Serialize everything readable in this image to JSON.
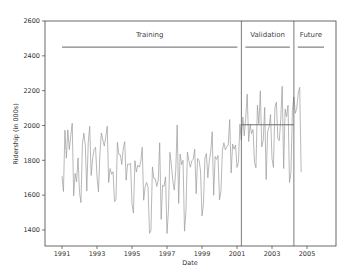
{
  "chart_data": {
    "type": "line",
    "title": "",
    "xlabel": "Date",
    "ylabel": "Ridership (in 000s)",
    "xlim": [
      1990.5,
      2006.6
    ],
    "ylim": [
      1308,
      2600
    ],
    "grid": false,
    "x_ticks": [
      "1991",
      "1993",
      "1995",
      "1997",
      "1999",
      "2001",
      "2003",
      "2005"
    ],
    "x_tick_values": [
      1991,
      1993,
      1995,
      1997,
      1999,
      2001,
      2003,
      2005
    ],
    "y_ticks": [
      "1400",
      "1600",
      "1800",
      "2000",
      "2200",
      "2400",
      "2600"
    ],
    "y_tick_values": [
      1400,
      1600,
      1800,
      2000,
      2200,
      2400,
      2600
    ],
    "partitions": [
      {
        "name": "Training",
        "start": 1991.0,
        "end": 2001.25
      },
      {
        "name": "Validation",
        "start": 2001.25,
        "end": 2004.25
      },
      {
        "name": "Future",
        "start": 2004.25,
        "end": 2006.2
      }
    ],
    "partition_label_y": 2450,
    "naive_forecast_value": 2004,
    "series": [
      {
        "name": "Ridership",
        "x_start": 1991.0,
        "x_step": 0.08333,
        "values": [
          1709,
          1621,
          1973,
          1812,
          1975,
          1862,
          1940,
          2013,
          1596,
          1725,
          1676,
          1814,
          1615,
          1557,
          1891,
          1956,
          1885,
          1623,
          1903,
          1996,
          1713,
          1810,
          1862,
          1875,
          1705,
          1619,
          1837,
          1957,
          1917,
          1882,
          1933,
          1996,
          1673,
          1753,
          1720,
          1734,
          1563,
          1574,
          1903,
          1834,
          1831,
          1776,
          1868,
          1907,
          1686,
          1779,
          1776,
          1783,
          1548,
          1497,
          1798,
          1733,
          1772,
          1761,
          1792,
          1875,
          1571,
          1647,
          1673,
          1646,
          1381,
          1396,
          1762,
          1695,
          1693,
          1650,
          1687,
          1901,
          1461,
          1657,
          1651,
          1705,
          1380,
          1510,
          1846,
          1773,
          1682,
          1629,
          1743,
          2003,
          1552,
          1836,
          1775,
          1800,
          1393,
          1509,
          1847,
          1799,
          1760,
          1798,
          1806,
          1864,
          1608,
          1811,
          1798,
          1739,
          1481,
          1547,
          1812,
          1839,
          1700,
          1797,
          1848,
          1964,
          1599,
          1822,
          1805,
          1828,
          1573,
          1622,
          1857,
          1901,
          1860,
          1878,
          1889,
          2034,
          1728,
          1893,
          1864,
          1888,
          1759,
          1789,
          2007,
          1916,
          2048,
          1941,
          2044,
          2180,
          1908,
          2006,
          1953,
          1977,
          1788,
          1757,
          2116,
          2010,
          2199,
          1877,
          1916,
          2104,
          1690,
          1963,
          1992,
          2063,
          1811,
          1759,
          2103,
          2134,
          1925,
          1913,
          2036,
          2225,
          1753,
          2094,
          2051,
          2116,
          1673,
          1729,
          2085,
          2164,
          2070,
          2100,
          2186,
          2219,
          1731
        ]
      }
    ]
  }
}
